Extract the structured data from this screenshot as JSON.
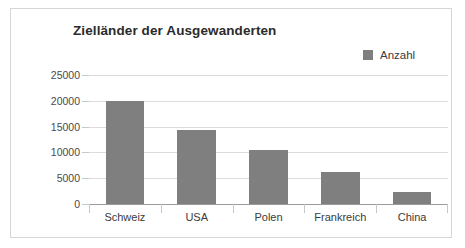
{
  "chart_data": {
    "type": "bar",
    "title": "Zielländer der Ausgewanderten",
    "xlabel": "",
    "ylabel": "",
    "categories": [
      "Schweiz",
      "USA",
      "Polen",
      "Frankreich",
      "China"
    ],
    "values": [
      20000,
      14300,
      10400,
      6300,
      2300
    ],
    "series": [
      {
        "name": "Anzahl",
        "values": [
          20000,
          14300,
          10400,
          6300,
          2300
        ]
      }
    ],
    "ylim": [
      0,
      25000
    ],
    "yticks": [
      0,
      5000,
      10000,
      15000,
      20000,
      25000
    ],
    "ytick_labels": [
      "0",
      "5000",
      "10000",
      "15000",
      "20000",
      "25000"
    ],
    "grid": true,
    "legend": {
      "position": "top-right",
      "entries": [
        {
          "label": "Anzahl",
          "color": "#7f7f7f"
        }
      ]
    },
    "colors": {
      "bar": "#7f7f7f",
      "gridline": "#dcdcdc",
      "axis": "#9a9a9a",
      "title_text": "#2b2b2b",
      "tick_text": "#4a4a4a",
      "frame_border": "#d6d6d6",
      "background": "#ffffff"
    }
  }
}
